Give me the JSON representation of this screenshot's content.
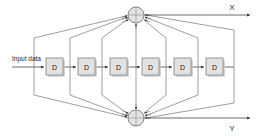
{
  "diagram": {
    "canvas": {
      "width": 263,
      "height": 136,
      "background": "#ffffff"
    },
    "colors": {
      "wire": "#5a5a5a",
      "box_fill": "#e2e2e2",
      "box_stroke": "#707070",
      "adder_fill": "#e4e4e4",
      "adder_stroke": "#6a6a6a",
      "text": "#1c1c1c"
    },
    "input": {
      "label": "Input data",
      "label_x": 12,
      "label_y": 58,
      "line_y": 67,
      "line_start_x": 12,
      "line_end_x": 44
    },
    "delay_boxes": [
      {
        "label": "D",
        "x": 46,
        "y": 58,
        "w": 17,
        "h": 17
      },
      {
        "label": "D",
        "x": 78,
        "y": 58,
        "w": 17,
        "h": 17
      },
      {
        "label": "D",
        "x": 110,
        "y": 58,
        "w": 17,
        "h": 17
      },
      {
        "label": "D",
        "x": 142,
        "y": 58,
        "w": 17,
        "h": 17
      },
      {
        "label": "D",
        "x": 174,
        "y": 58,
        "w": 17,
        "h": 17
      },
      {
        "label": "D",
        "x": 206,
        "y": 58,
        "w": 17,
        "h": 17
      }
    ],
    "adders": [
      {
        "name": "top-adder",
        "cx": 136,
        "cy": 15,
        "r": 8
      },
      {
        "name": "bottom-adder",
        "cx": 136,
        "cy": 118,
        "r": 8
      }
    ],
    "outputs": [
      {
        "label": "X",
        "label_x": 232,
        "label_y": 7,
        "line_y": 15,
        "line_start_x": 144,
        "line_end_x": 250
      },
      {
        "label": "Y",
        "label_x": 232,
        "label_y": 128,
        "line_y": 118,
        "line_start_x": 144,
        "line_end_x": 250
      }
    ],
    "tap_points_x": [
      34,
      70,
      102,
      134,
      166,
      198,
      232
    ],
    "tap_riser_top_y": 38,
    "tap_riser_bottom_y": 95,
    "counts": {
      "delay_elements": 6,
      "adders": 2,
      "outputs": 2
    }
  }
}
